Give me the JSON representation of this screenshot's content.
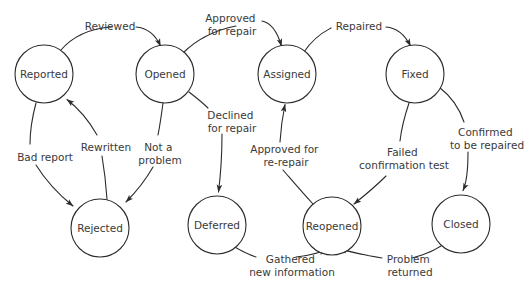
{
  "diagram": {
    "type": "state-transition-diagram",
    "colors": {
      "background": "#ffffff",
      "stroke": "#2b2b2b",
      "text": "#3a3a3a"
    },
    "states": [
      {
        "id": "reported",
        "label": "Reported",
        "cx": 44,
        "cy": 74,
        "r": 29
      },
      {
        "id": "opened",
        "label": "Opened",
        "cx": 165,
        "cy": 74,
        "r": 29
      },
      {
        "id": "assigned",
        "label": "Assigned",
        "cx": 287,
        "cy": 74,
        "r": 29
      },
      {
        "id": "fixed",
        "label": "Fixed",
        "cx": 415,
        "cy": 74,
        "r": 29
      },
      {
        "id": "rejected",
        "label": "Rejected",
        "cx": 100,
        "cy": 228,
        "r": 29
      },
      {
        "id": "deferred",
        "label": "Deferred",
        "cx": 217,
        "cy": 225,
        "r": 29
      },
      {
        "id": "reopened",
        "label": "Reopened",
        "cx": 332,
        "cy": 226,
        "r": 29
      },
      {
        "id": "closed",
        "label": "Closed",
        "cx": 461,
        "cy": 224,
        "r": 29
      }
    ],
    "transitions": [
      {
        "id": "t-reviewed",
        "from": "reported",
        "to": "opened",
        "label": [
          "Reviewed"
        ],
        "label_x": 110,
        "label_y": 26
      },
      {
        "id": "t-approved-repair",
        "from": "opened",
        "to": "assigned",
        "label": [
          "Approved",
          "for repair"
        ],
        "label_x": 232,
        "label_y": 20
      },
      {
        "id": "t-repaired",
        "from": "assigned",
        "to": "fixed",
        "label": [
          "Repaired"
        ],
        "label_x": 359,
        "label_y": 26
      },
      {
        "id": "t-bad-report",
        "from": "reported",
        "to": "rejected",
        "label": [
          "Bad report"
        ],
        "label_x": 45,
        "label_y": 157
      },
      {
        "id": "t-rewritten",
        "from": "rejected",
        "to": "reported",
        "label": [
          "Rewritten"
        ],
        "label_x": 106,
        "label_y": 147
      },
      {
        "id": "t-not-a-problem",
        "from": "opened",
        "to": "rejected",
        "label": [
          "Not a",
          "problem"
        ],
        "label_x": 160,
        "label_y": 147
      },
      {
        "id": "t-declined",
        "from": "opened",
        "to": "deferred",
        "label": [
          "Declined",
          "for repair"
        ],
        "label_x": 232,
        "label_y": 117
      },
      {
        "id": "t-gathered",
        "from": "deferred",
        "to": "reopened",
        "label": [
          "Gathered",
          "new information"
        ],
        "label_x": 292,
        "label_y": 262
      },
      {
        "id": "t-approved-re",
        "from": "reopened",
        "to": "assigned",
        "label": [
          "Approved for",
          "re-repair"
        ],
        "label_x": 286,
        "label_y": 151
      },
      {
        "id": "t-failed-test",
        "from": "fixed",
        "to": "reopened",
        "label": [
          "Failed",
          "confirmation test"
        ],
        "label_x": 404,
        "label_y": 154
      },
      {
        "id": "t-confirmed",
        "from": "fixed",
        "to": "closed",
        "label": [
          "Confirmed",
          "to be repaired"
        ],
        "label_x": 487,
        "label_y": 134
      },
      {
        "id": "t-problem-return",
        "from": "closed",
        "to": "reopened",
        "label": [
          "Problem",
          "returned"
        ],
        "label_x": 410,
        "label_y": 262
      }
    ]
  }
}
